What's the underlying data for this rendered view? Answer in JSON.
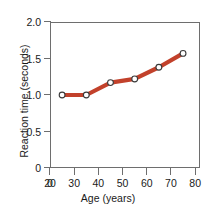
{
  "chart_data": {
    "type": "line",
    "title": "",
    "xlabel": "Age (years)",
    "ylabel": "Reaction time (seconds)",
    "x": [
      25,
      35,
      45,
      55,
      65,
      75
    ],
    "values": [
      1.0,
      1.0,
      1.17,
      1.22,
      1.38,
      1.57
    ],
    "series": [
      {
        "name": "Reaction time",
        "values": [
          1.0,
          1.0,
          1.17,
          1.22,
          1.38,
          1.57
        ]
      }
    ],
    "xlim": [
      20,
      82
    ],
    "ylim": [
      0,
      2.0
    ],
    "x_ticks": [
      {
        "value": 0,
        "label": "0"
      },
      {
        "value": 20,
        "label": "20"
      },
      {
        "value": 30,
        "label": "30"
      },
      {
        "value": 40,
        "label": "40"
      },
      {
        "value": 50,
        "label": "50"
      },
      {
        "value": 60,
        "label": "60"
      },
      {
        "value": 70,
        "label": "70"
      },
      {
        "value": 80,
        "label": "80"
      }
    ],
    "y_ticks": [
      {
        "value": 2.0,
        "label": "2.0"
      },
      {
        "value": 1.5,
        "label": "1.5"
      },
      {
        "value": 1.0,
        "label": "1.0"
      },
      {
        "value": 0.5,
        "label": "0.5"
      },
      {
        "value": 0.0,
        "label": "0"
      }
    ],
    "grid": false,
    "legend": null,
    "axis_break_x": true,
    "line_color": "#c2412b",
    "marker_fill": "#ffffff",
    "marker_stroke": "#3a3a3a",
    "axis_color": "#6e6e6e",
    "text_color": "#1a1a1a",
    "background": "#ffffff"
  }
}
